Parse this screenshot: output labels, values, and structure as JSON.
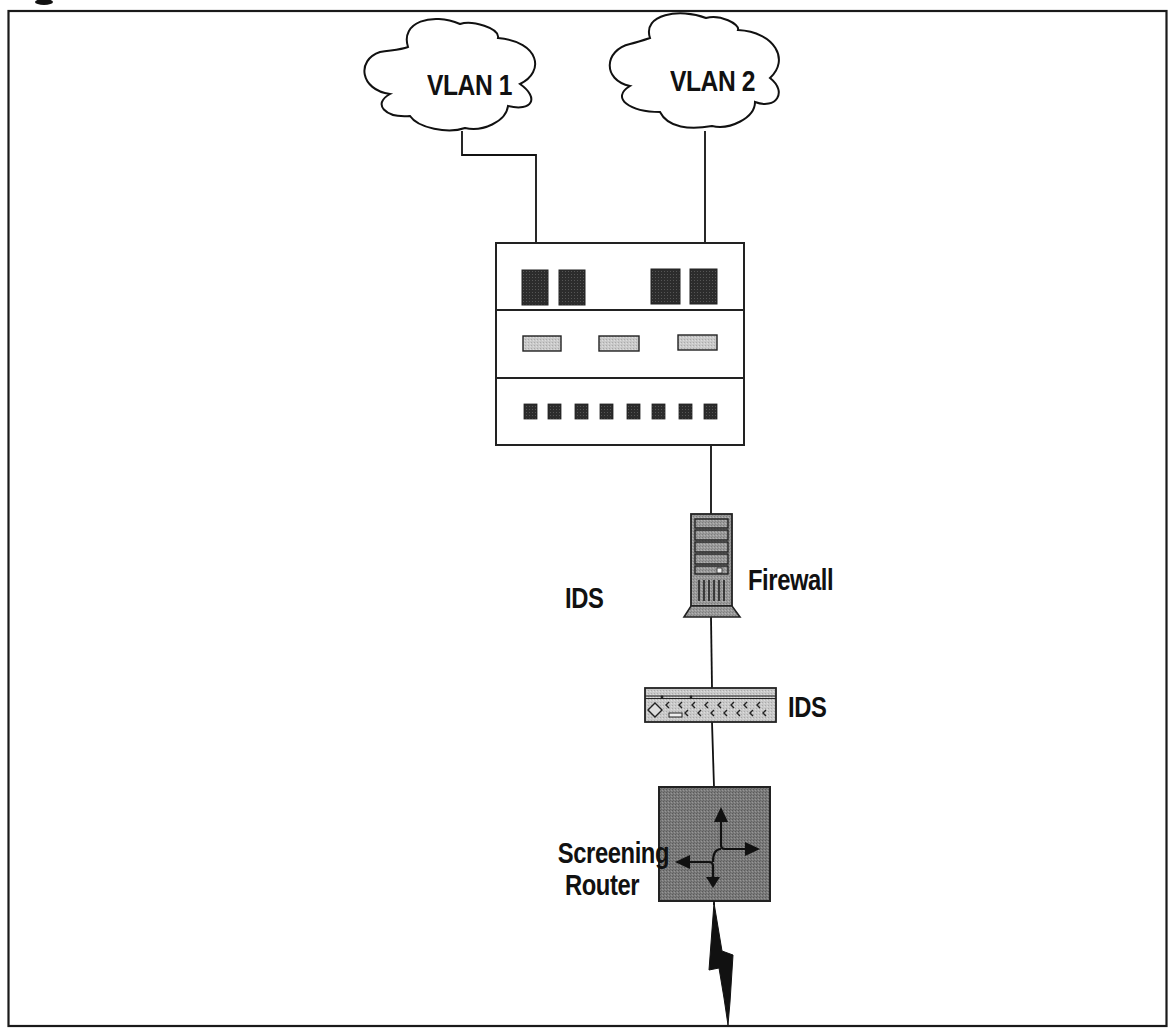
{
  "figure": {
    "title_fragment": "",
    "frame_color": "#1a1a1a",
    "background": "#ffffff"
  },
  "nodes": {
    "vlan1": {
      "label": "VLAN 1",
      "type": "cloud"
    },
    "vlan2": {
      "label": "VLAN 2",
      "type": "cloud"
    },
    "switch": {
      "label": "",
      "type": "switch",
      "top_ports": 4,
      "middle_slots": 3,
      "bottom_ports": 8,
      "port_color": "#2a2a2a",
      "slot_color": "#cfcfcf"
    },
    "firewall": {
      "label": "Firewall",
      "type": "tower-server",
      "fill": "#8a8a8a"
    },
    "ids_left_label": {
      "label": "IDS"
    },
    "ids": {
      "label": "IDS",
      "type": "rack-appliance",
      "fill": "#b5b5b5"
    },
    "router": {
      "label_line1": "Screening",
      "label_line2": "Router",
      "type": "router",
      "fill": "#7d7d7d"
    },
    "wan": {
      "type": "lightning-bolt",
      "label": ""
    }
  },
  "edges": [
    {
      "from": "VLAN 1",
      "to": "Switch"
    },
    {
      "from": "VLAN 2",
      "to": "Switch"
    },
    {
      "from": "Switch",
      "to": "Firewall"
    },
    {
      "from": "Firewall",
      "to": "IDS"
    },
    {
      "from": "IDS",
      "to": "Screening Router"
    },
    {
      "from": "Screening Router",
      "to": "WAN link"
    }
  ]
}
